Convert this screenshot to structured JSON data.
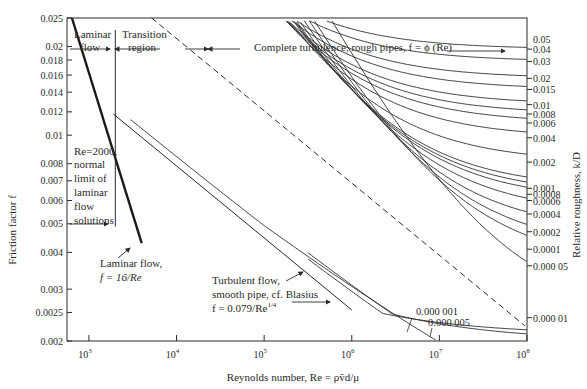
{
  "chart_data": {
    "type": "line",
    "xlabel": "Reynolds number, Re = ρv̄d/μ",
    "ylabel": "Friction factor f",
    "y2label": "Relative roughness, k/D",
    "xscale": "log",
    "yscale": "log",
    "xlim": [
      562,
      100000000
    ],
    "ylim": [
      0.002,
      0.025
    ],
    "grid": false,
    "x_ticks": [
      {
        "value": 1000,
        "label": "10³"
      },
      {
        "value": 10000,
        "label": "10⁴"
      },
      {
        "value": 100000,
        "label": "10⁵"
      },
      {
        "value": 1000000,
        "label": "10⁶"
      },
      {
        "value": 10000000,
        "label": "10⁷"
      },
      {
        "value": 100000000,
        "label": "10⁸"
      }
    ],
    "y_ticks": [
      {
        "value": 0.025,
        "label": "0.025"
      },
      {
        "value": 0.02,
        "label": "0.02"
      },
      {
        "value": 0.018,
        "label": "0.018"
      },
      {
        "value": 0.016,
        "label": "0.016"
      },
      {
        "value": 0.014,
        "label": "0.014"
      },
      {
        "value": 0.012,
        "label": "0.012"
      },
      {
        "value": 0.01,
        "label": "0.01"
      },
      {
        "value": 0.008,
        "label": "0.008"
      },
      {
        "value": 0.007,
        "label": "0.007"
      },
      {
        "value": 0.006,
        "label": "0.006"
      },
      {
        "value": 0.005,
        "label": "0.005"
      },
      {
        "value": 0.004,
        "label": "0.004"
      },
      {
        "value": 0.003,
        "label": "0.003"
      },
      {
        "value": 0.0025,
        "label": "0.0025"
      },
      {
        "value": 0.002,
        "label": "0.002"
      }
    ],
    "roughness_curves": [
      {
        "k_D": "0.05",
        "label": "0.05",
        "f_asymptote": 0.0212,
        "labelOnly": true
      },
      {
        "k_D": "0.04",
        "label": "0.04",
        "f_asymptote": 0.0196
      },
      {
        "k_D": "0.03",
        "label": "0.03",
        "f_asymptote": 0.0178
      },
      {
        "k_D": "0.02",
        "label": "0.02",
        "f_asymptote": 0.0156
      },
      {
        "k_D": "0.015",
        "label": "0.015",
        "f_asymptote": 0.0143
      },
      {
        "k_D": "0.01",
        "label": "0.01",
        "f_asymptote": 0.0127
      },
      {
        "k_D": "0.008",
        "label": "0.008",
        "f_asymptote": 0.0118
      },
      {
        "k_D": "0.006",
        "label": "0.006",
        "f_asymptote": 0.011
      },
      {
        "k_D": "0.004",
        "label": "0.004",
        "f_asymptote": 0.0098
      },
      {
        "k_D": "0.002",
        "label": "0.002",
        "f_asymptote": 0.0081
      },
      {
        "k_D": "0.001",
        "label": "0.001",
        "f_asymptote": 0.0066
      },
      {
        "k_D": "0.0008",
        "label": "0.0008",
        "f_asymptote": 0.0063
      },
      {
        "k_D": "0.0006",
        "label": "0.0006",
        "f_asymptote": 0.006
      },
      {
        "k_D": "0.0004",
        "label": "0.0004",
        "f_asymptote": 0.0054
      },
      {
        "k_D": "0.0002",
        "label": "0.0002",
        "f_asymptote": 0.0047
      },
      {
        "k_D": "0.0001",
        "label": "0.0001",
        "f_asymptote": 0.0041
      },
      {
        "k_D": "0.00005",
        "label": "0.000 05",
        "f_asymptote": 0.0036
      },
      {
        "k_D": "0.00001",
        "label": "0.000 01",
        "f_asymptote": 0.0024
      }
    ],
    "small_roughness_labels": [
      "0.000 001",
      "0.000 005"
    ],
    "series": [
      {
        "name": "Laminar flow, f = 16/Re",
        "x": [
          640,
          4000
        ],
        "y": [
          0.025,
          0.004
        ]
      },
      {
        "name": "Turbulent flow, smooth pipe, cf. Blasius f = 0.079/Re^1/4",
        "x": [
          2000,
          1000000
        ],
        "y": [
          0.0118,
          0.0025
        ]
      },
      {
        "name": "Complete turbulence boundary (dashed)",
        "x": [
          6000,
          100000000
        ],
        "y": [
          0.025,
          0.0022
        ]
      }
    ],
    "annotations": [
      "Laminar flow",
      "Transition region",
      "Complete turbulence, rough pipes, f = ϕ (Re)",
      "Re=2000, normal limit of laminar flow solutions",
      "Laminar flow, f = 16/Re",
      "Turbulent flow, smooth pipe, cf. Blasius f = 0.079/Re^1/4"
    ]
  },
  "labels": {
    "laminar_region_1": "Laminar",
    "laminar_region_2": "flow",
    "transition_1": "Transition",
    "transition_2": "region",
    "complete_turbulence": "Complete turbulence, rough pipes, f = ϕ (Re)",
    "re2000_1": "Re=2000,",
    "re2000_2": "normal",
    "re2000_3": "limit of",
    "re2000_4": "laminar",
    "re2000_5": "flow",
    "re2000_6": "solutions",
    "laminar_flow_1": "Laminar flow,",
    "laminar_flow_2": "f = 16/Re",
    "blasius_1": "Turbulent flow,",
    "blasius_2": "smooth pipe, cf. Blasius",
    "blasius_3": "f = 0.079/Re",
    "blasius_exp": "1/4",
    "small_1": "0.000 001",
    "small_2": "0.000 005",
    "xlabel": "Reynolds number, Re = ρv̄d/μ",
    "ylabel": "Friction factor f",
    "y2label": "Relative roughness, k/D"
  }
}
